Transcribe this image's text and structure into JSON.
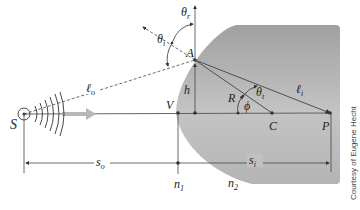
{
  "diagram": {
    "colors": {
      "medium": "#a9a9a9",
      "medium_light": "#d9d9d9",
      "lines": "#333333",
      "ray_arrow": "#b5b5b5"
    },
    "points": {
      "S": "S",
      "A": "A",
      "V": "V",
      "C": "C",
      "P": "P",
      "R": "R",
      "h": "h"
    },
    "angles": {
      "theta_r": "θ",
      "theta_r_sub": "r",
      "theta_i": "θ",
      "theta_i_sub": "i",
      "theta_t": "θ",
      "theta_t_sub": "t",
      "phi": "ϕ"
    },
    "lengths": {
      "l_o": "ℓ",
      "l_o_sub": "o",
      "l_i": "ℓ",
      "l_i_sub": "i",
      "s_o": "s",
      "s_o_sub": "o",
      "s_i": "s",
      "s_i_sub": "i"
    },
    "media": {
      "n1": "n",
      "n1_sub": "1",
      "n2": "n",
      "n2_sub": "2"
    },
    "credit": "Courtesy of Eugene Hecht"
  }
}
